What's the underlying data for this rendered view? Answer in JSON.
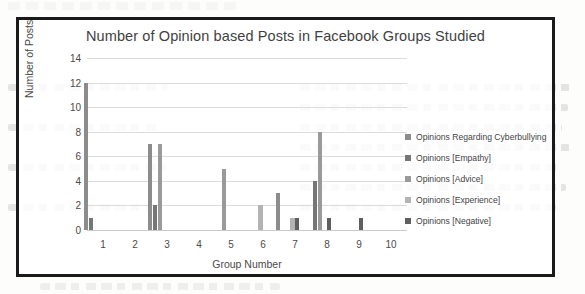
{
  "page": {
    "background_color": "#fdfdfb",
    "frame_border_color": "#1a1a1a"
  },
  "chart_data": {
    "type": "bar",
    "title": "Number of Opinion based Posts in Facebook Groups Studied",
    "xlabel": "Group Number",
    "ylabel": "Number of Posts",
    "categories": [
      "1",
      "2",
      "3",
      "4",
      "5",
      "6",
      "7",
      "8",
      "9",
      "10"
    ],
    "ylim": [
      0,
      14
    ],
    "ytick_step": 2,
    "yticks": [
      "0",
      "2",
      "4",
      "6",
      "8",
      "10",
      "12",
      "14"
    ],
    "grid": true,
    "grid_axis": "y",
    "legend_position": "right",
    "series": [
      {
        "name": "Opinions Regarding Cyberbullying",
        "color": "#8c8c8c",
        "values": [
          12,
          0,
          7,
          0,
          0,
          0,
          3,
          0,
          0,
          0
        ]
      },
      {
        "name": "Opinions [Empathy]",
        "color": "#767676",
        "values": [
          1,
          0,
          2,
          0,
          0,
          0,
          0,
          4,
          0,
          0
        ]
      },
      {
        "name": "Opinions [Advice]",
        "color": "#9a9a9a",
        "values": [
          0,
          0,
          7,
          0,
          5,
          0,
          0,
          8,
          0,
          0
        ]
      },
      {
        "name": "Opinions [Experience]",
        "color": "#b3b3b3",
        "values": [
          0,
          0,
          0,
          0,
          0,
          2,
          1,
          0,
          0,
          0
        ]
      },
      {
        "name": "Opinions [Negative]",
        "color": "#5f5f5f",
        "values": [
          0,
          0,
          0,
          0,
          0,
          0,
          1,
          1,
          1,
          0
        ]
      }
    ]
  }
}
